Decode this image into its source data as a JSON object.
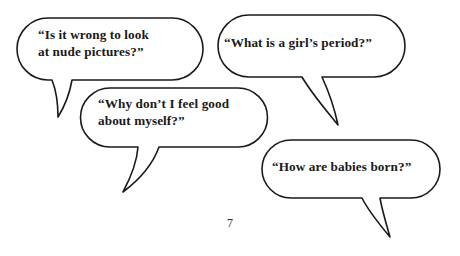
{
  "page": {
    "background_color": "#ffffff",
    "ink_color": "#1a1a1a",
    "page_number": "7"
  },
  "bubbles": [
    {
      "id": "bubble-1",
      "text": "“Is it wrong to look\nat nude pictures?”",
      "tail_direction": "down-left"
    },
    {
      "id": "bubble-2",
      "text": "“What is a girl’s period?”",
      "tail_direction": "down-right"
    },
    {
      "id": "bubble-3",
      "text": "“Why don’t I feel good\nabout myself?”",
      "tail_direction": "down-left"
    },
    {
      "id": "bubble-4",
      "text": "“How are babies born?”",
      "tail_direction": "down-right"
    }
  ]
}
